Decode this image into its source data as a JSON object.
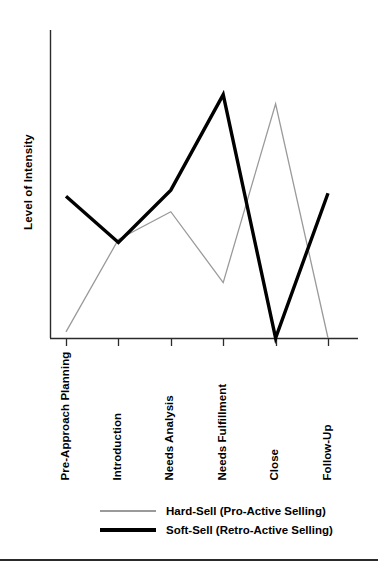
{
  "chart_data": {
    "type": "line",
    "title": "",
    "xlabel": "",
    "ylabel": "Level of Intensity",
    "ylim": [
      0,
      100
    ],
    "grid": false,
    "legend_position": "bottom",
    "categories": [
      "Pre-Approach Planning",
      "Introduction",
      "Needs Analysis",
      "Needs Fulfillment",
      "Close",
      "Follow-Up"
    ],
    "series": [
      {
        "name": "Hard-Sell (Pro-Active Selling)",
        "color": "#9a9a9a",
        "line_width": 1.3,
        "values": [
          2,
          32,
          41,
          18,
          76,
          0
        ]
      },
      {
        "name": "Soft-Sell (Retro-Active Selling)",
        "color": "#000000",
        "line_width": 3.4,
        "values": [
          46,
          31,
          48,
          79,
          0,
          47
        ]
      }
    ],
    "axis_color": "#2b2b2b",
    "y_axis_show_ticks": false,
    "x_axis_show_ticks": true
  },
  "axes": {
    "y_title": "Level of Intensity"
  },
  "legend": {
    "entries": [
      {
        "label": "Hard-Sell (Pro-Active Selling)"
      },
      {
        "label": "Soft-Sell (Retro-Active Selling)"
      }
    ]
  },
  "footer": {
    "rule_color": "#2b2b2b"
  }
}
